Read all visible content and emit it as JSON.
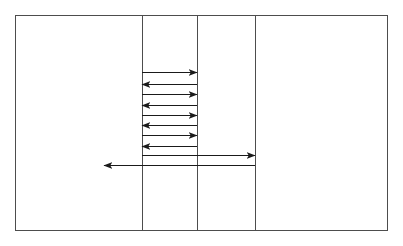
{
  "canvas": {
    "width": 403,
    "height": 246,
    "background": "#ffffff"
  },
  "diagram": {
    "type": "sequence-timing-diagram",
    "title": "",
    "stroke_color": "#4d4d4d",
    "arrow_color": "#1a1a1a",
    "stroke_width": 1,
    "frame": {
      "label": "outer-frame",
      "x": 15,
      "y": 15,
      "width": 373,
      "height": 216,
      "right": 388,
      "bottom": 231
    },
    "lifelines": [
      {
        "name": "lifeline-1",
        "x": 15,
        "y_top": 15,
        "y_bottom": 231
      },
      {
        "name": "lifeline-2",
        "x": 142,
        "y_top": 15,
        "y_bottom": 231
      },
      {
        "name": "lifeline-3",
        "x": 197,
        "y_top": 15,
        "y_bottom": 231
      },
      {
        "name": "lifeline-4",
        "x": 255,
        "y_top": 15,
        "y_bottom": 231
      },
      {
        "name": "lifeline-5",
        "x": 388,
        "y_top": 15,
        "y_bottom": 231
      }
    ],
    "lanes": [
      {
        "name": "lane-1",
        "x_start": 15,
        "x_end": 142
      },
      {
        "name": "lane-2",
        "x_start": 142,
        "x_end": 197
      },
      {
        "name": "lane-3",
        "x_start": 197,
        "x_end": 255
      },
      {
        "name": "lane-4",
        "x_start": 255,
        "x_end": 388
      }
    ],
    "arrows": [
      {
        "name": "arrow-1",
        "direction": "right",
        "x_from": 142,
        "x_to": 197,
        "y": 72,
        "label": ""
      },
      {
        "name": "arrow-2",
        "direction": "left",
        "x_from": 197,
        "x_to": 142,
        "y": 84,
        "label": ""
      },
      {
        "name": "arrow-3",
        "direction": "right",
        "x_from": 142,
        "x_to": 197,
        "y": 94,
        "label": ""
      },
      {
        "name": "arrow-4",
        "direction": "left",
        "x_from": 197,
        "x_to": 142,
        "y": 105,
        "label": ""
      },
      {
        "name": "arrow-5",
        "direction": "right",
        "x_from": 142,
        "x_to": 197,
        "y": 115,
        "label": ""
      },
      {
        "name": "arrow-6",
        "direction": "left",
        "x_from": 197,
        "x_to": 142,
        "y": 125,
        "label": ""
      },
      {
        "name": "arrow-7",
        "direction": "right",
        "x_from": 142,
        "x_to": 197,
        "y": 135,
        "label": ""
      },
      {
        "name": "arrow-8",
        "direction": "left",
        "x_from": 197,
        "x_to": 142,
        "y": 146,
        "label": ""
      },
      {
        "name": "arrow-9",
        "direction": "right",
        "x_from": 142,
        "x_to": 255,
        "y": 155,
        "label": ""
      },
      {
        "name": "arrow-10",
        "direction": "left",
        "x_from": 255,
        "x_to": 104,
        "y": 165,
        "label": ""
      }
    ]
  }
}
